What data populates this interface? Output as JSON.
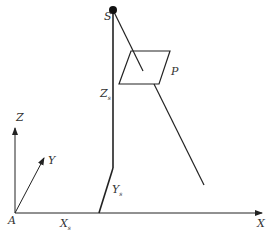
{
  "diagram": {
    "type": "coordinate-geometry",
    "colors": {
      "line": "#222222",
      "background": "#ffffff"
    },
    "labels": {
      "S": "S",
      "P": "P",
      "Z": "Z",
      "Y": "Y",
      "X": "X",
      "A": "A",
      "Zs": "Z",
      "Zs_sub": "s",
      "Ys": "Y",
      "Ys_sub": "s",
      "Xs": "X",
      "Xs_sub": "s"
    },
    "elements": [
      {
        "id": "origin",
        "label": "A"
      },
      {
        "id": "axis-x",
        "label": "X"
      },
      {
        "id": "axis-y",
        "label": "Y"
      },
      {
        "id": "axis-z",
        "label": "Z"
      },
      {
        "id": "source-point",
        "label": "S"
      },
      {
        "id": "plane",
        "label": "P"
      },
      {
        "id": "offset-x",
        "label": "Xs"
      },
      {
        "id": "offset-y",
        "label": "Ys"
      },
      {
        "id": "offset-z",
        "label": "Zs"
      }
    ]
  }
}
